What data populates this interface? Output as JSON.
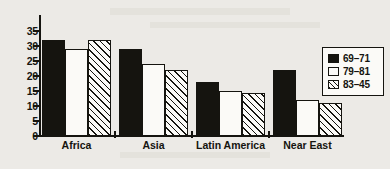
{
  "chart_data": {
    "type": "bar",
    "title": "",
    "subtitle": "",
    "xlabel": "",
    "ylabel": "",
    "categories": [
      "Africa",
      "Asia",
      "Latin America",
      "Near East"
    ],
    "series": [
      {
        "name": "69-71",
        "label": "69–71",
        "fill": "solid-black",
        "values": [
          32,
          29,
          18,
          22
        ]
      },
      {
        "name": "79-81",
        "label": "79–81",
        "fill": "white-outline",
        "values": [
          29,
          24,
          15,
          12
        ]
      },
      {
        "name": "83-45",
        "label": "83–45",
        "fill": "diagonal-hatch",
        "values": [
          32,
          22,
          14.5,
          11
        ]
      }
    ],
    "ylim": [
      0,
      35
    ],
    "ytick_labels": [
      "35",
      "30",
      "25",
      "20",
      "15",
      "10",
      "5",
      "0"
    ],
    "ytick_values": [
      35,
      30,
      25,
      20,
      15,
      10,
      5,
      0
    ],
    "grid": false,
    "legend_position": "right",
    "colors": {
      "ink": "#15140f",
      "paper": "#eceae6",
      "bar_fill_light": "#fbfaf7"
    }
  },
  "legend": {
    "entries": [
      {
        "label": "69–71"
      },
      {
        "label": "79–81"
      },
      {
        "label": "83–45"
      }
    ]
  }
}
